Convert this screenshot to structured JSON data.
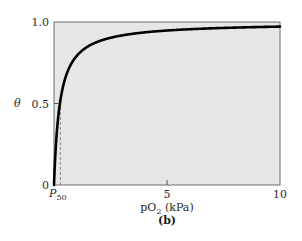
{
  "chart_data": {
    "type": "line",
    "title": "",
    "panel_label": "(b)",
    "xlabel": "pO2 (kPa)",
    "xlabel_main": "pO",
    "xlabel_sub": "2",
    "xlabel_unit": " (kPa)",
    "ylabel": "θ",
    "xlim": [
      0,
      10
    ],
    "ylim": [
      0,
      1.0
    ],
    "x_ticks": [
      0,
      5,
      10
    ],
    "x_tick_labels": [
      "",
      "5",
      "10"
    ],
    "y_ticks": [
      0,
      0.5,
      1.0
    ],
    "y_tick_labels": [
      "0",
      "0.5",
      "1.0"
    ],
    "grid": false,
    "background_color": "#e6e6e6",
    "line_color": "#000000",
    "annotations": [
      {
        "text": "P50",
        "main": "P",
        "sub": "50",
        "x": 0.26,
        "note": "dashed vertical line from axis to curve at θ = 0.5"
      }
    ],
    "series": [
      {
        "name": "θ = pO2 / (pO2 + P50)",
        "p50": 0.26,
        "x": [
          0,
          0.05,
          0.1,
          0.2,
          0.26,
          0.4,
          0.6,
          0.8,
          1.0,
          1.5,
          2.0,
          3.0,
          4.0,
          5.0,
          6.0,
          7.0,
          8.0,
          9.0,
          10.0
        ],
        "values": [
          0,
          0.16,
          0.28,
          0.43,
          0.5,
          0.61,
          0.7,
          0.75,
          0.79,
          0.85,
          0.88,
          0.92,
          0.94,
          0.95,
          0.96,
          0.96,
          0.97,
          0.97,
          0.97
        ]
      }
    ]
  }
}
